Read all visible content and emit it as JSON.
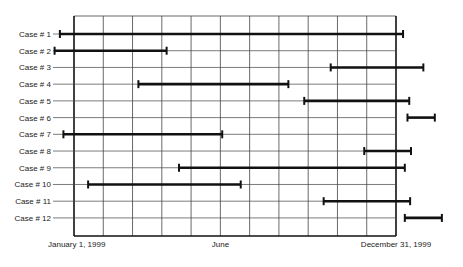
{
  "chart_data": {
    "type": "gantt",
    "title": "",
    "xlabel": "",
    "ylabel": "",
    "x_unit": "day of 1999 (0 = January 1, 1999; 365 = December 31, 1999)",
    "xlim": [
      0,
      365
    ],
    "grid": true,
    "grid_columns": 11,
    "x_tick_labels": [
      {
        "label": "January 1, 1999",
        "day": 0
      },
      {
        "label": "June",
        "day": 166
      },
      {
        "label": "December 31, 1999",
        "day": 365
      }
    ],
    "categories": [
      "Case # 1",
      "Case # 2",
      "Case # 3",
      "Case # 4",
      "Case # 5",
      "Case # 6",
      "Case # 7",
      "Case # 8",
      "Case # 9",
      "Case # 10",
      "Case # 11",
      "Case # 12"
    ],
    "series": [
      {
        "name": "Case # 1",
        "start": -16,
        "end": 373
      },
      {
        "name": "Case # 2",
        "start": -22,
        "end": 105
      },
      {
        "name": "Case # 3",
        "start": 291,
        "end": 396
      },
      {
        "name": "Case # 4",
        "start": 73,
        "end": 243
      },
      {
        "name": "Case # 5",
        "start": 261,
        "end": 380
      },
      {
        "name": "Case # 6",
        "start": 378,
        "end": 409
      },
      {
        "name": "Case # 7",
        "start": -12,
        "end": 168
      },
      {
        "name": "Case # 8",
        "start": 329,
        "end": 382
      },
      {
        "name": "Case # 9",
        "start": 119,
        "end": 375
      },
      {
        "name": "Case # 10",
        "start": 16,
        "end": 189
      },
      {
        "name": "Case # 11",
        "start": 283,
        "end": 381
      },
      {
        "name": "Case # 12",
        "start": 375,
        "end": 417
      }
    ],
    "colors": {
      "bar": "#111111",
      "grid": "#444444",
      "frame": "#111111",
      "text": "#222222"
    }
  }
}
